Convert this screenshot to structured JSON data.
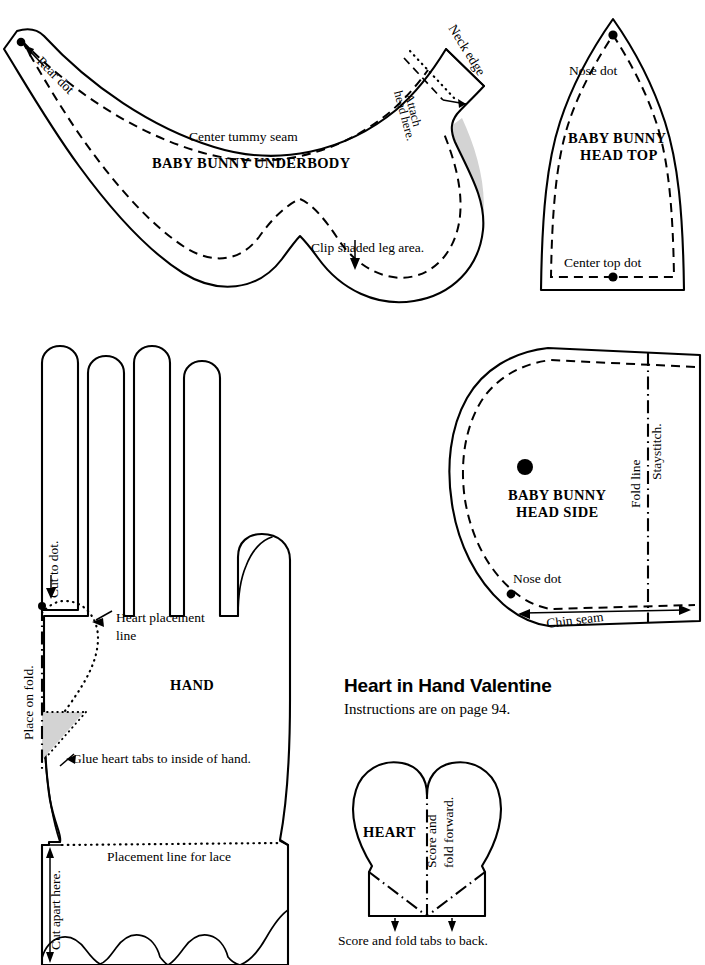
{
  "page": {
    "background_color": "#ffffff",
    "ink_color": "#000000",
    "shade_color": "#d3d3d3"
  },
  "project": {
    "title": "Heart in Hand Valentine",
    "instructions": "Instructions are on page 94."
  },
  "pieces": {
    "underbody": {
      "name_line1": "BABY BUNNY UNDERBODY",
      "labels": {
        "rear_dot": "Rear dot",
        "center_tummy_seam": "Center tummy seam",
        "neck_edge": "Neck edge",
        "attach_head_line1": "Attach",
        "attach_head_line2": "head here.",
        "clip_shaded": "Clip shaded leg area."
      }
    },
    "head_top": {
      "name_line1": "BABY BUNNY",
      "name_line2": "HEAD TOP",
      "labels": {
        "nose_dot": "Nose dot",
        "center_top_dot": "Center top dot"
      }
    },
    "head_side": {
      "name_line1": "BABY BUNNY",
      "name_line2": "HEAD SIDE",
      "labels": {
        "staystitch": "Staystitch.",
        "fold_line": "Fold line",
        "nose_dot": "Nose dot",
        "chin_seam": "Chin seam"
      }
    },
    "hand": {
      "name_line1": "HAND",
      "labels": {
        "cut_to_dot": "Cut to dot.",
        "heart_placement_line1": "Heart placement",
        "heart_placement_line2": "line",
        "place_on_fold": "Place on fold.",
        "glue_heart_tabs": "Glue heart tabs to inside of hand.",
        "placement_line_for_lace": "Placement line for lace",
        "cut_apart_here": "Cut apart here."
      }
    },
    "heart": {
      "name_line1": "HEART",
      "labels": {
        "score_fold_forward_line1": "Score and",
        "score_fold_forward_line2": "fold forward.",
        "score_fold_tabs": "Score and fold tabs to back."
      }
    }
  }
}
